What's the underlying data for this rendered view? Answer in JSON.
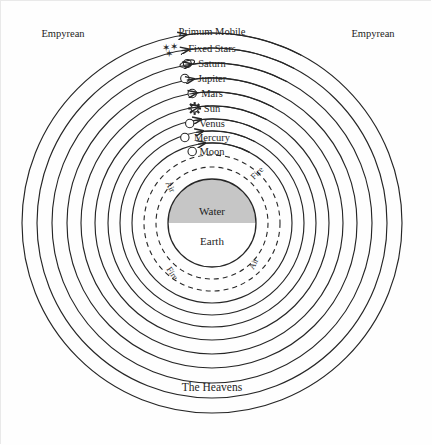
{
  "diagram": {
    "title_hidden": "Geocentric cosmos diagram",
    "corner_labels": [
      {
        "text": "Empyrean",
        "position": "top-left"
      },
      {
        "text": "Empyrean",
        "position": "top-right"
      }
    ],
    "bottom_label": "The Heavens",
    "celestial_spheres": [
      {
        "name": "Primum Mobile",
        "icon": "none",
        "radius": 190,
        "label_y": 30
      },
      {
        "name": "Fixed Stars",
        "icon": "stars-icon",
        "radius": 175,
        "label_y": 47
      },
      {
        "name": "Saturn",
        "icon": "saturn-icon",
        "radius": 160,
        "label_y": 62
      },
      {
        "name": "Jupiter",
        "icon": "circle-icon",
        "radius": 145,
        "label_y": 77
      },
      {
        "name": "Mars",
        "icon": "circle-icon",
        "radius": 131,
        "label_y": 92
      },
      {
        "name": "Sun",
        "icon": "sun-icon",
        "radius": 117,
        "label_y": 107
      },
      {
        "name": "Venus",
        "icon": "circle-icon",
        "radius": 104,
        "label_y": 122
      },
      {
        "name": "Mercury",
        "icon": "circle-icon",
        "radius": 92,
        "label_y": 136
      },
      {
        "name": "Moon",
        "icon": "circle-icon",
        "radius": 80,
        "label_y": 150
      }
    ],
    "elemental_spheres": [
      {
        "name": "Fire",
        "style": "dashed",
        "radius": 68
      },
      {
        "name": "Air",
        "style": "dashed",
        "radius": 56
      }
    ],
    "element_labels": [
      {
        "text": "Fire",
        "side": "upper-right"
      },
      {
        "text": "Air",
        "side": "upper-left"
      },
      {
        "text": "Air",
        "side": "lower-right"
      },
      {
        "text": "Fire",
        "side": "lower-left"
      }
    ],
    "core": {
      "upper_label": "Water",
      "lower_label": "Earth",
      "radius": 44,
      "water_color": "#c6c6c6",
      "earth_color": "#ffffff"
    },
    "rotation_arrows": {
      "count": 9,
      "direction": "counter-clockwise",
      "description": "curved arrows pointing left"
    },
    "colors": {
      "line": "#262626",
      "background": "#fefefe",
      "water_fill": "#c6c6c6",
      "text": "#1d1d1d"
    },
    "center": {
      "cx": 211,
      "cy": 222
    }
  }
}
